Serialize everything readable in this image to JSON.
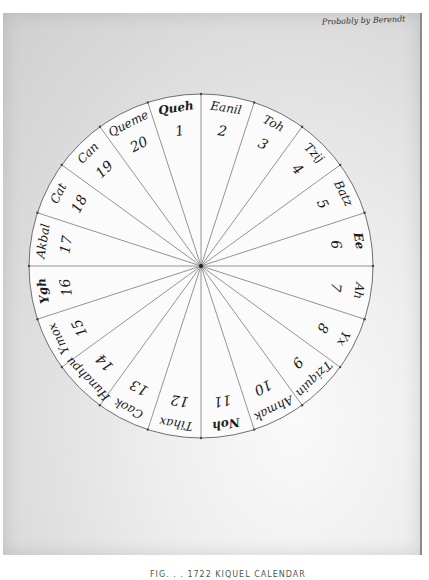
{
  "document": {
    "annotation": "Probably by Berendt",
    "caption": "FIG. . . 1722 KIQUEL CALENDAR"
  },
  "wheel": {
    "center": [
      201,
      266
    ],
    "radius": 172,
    "sectors": 20,
    "line_color": "#7a7a7a",
    "days": [
      {
        "num": "1",
        "name": "Queh"
      },
      {
        "num": "2",
        "name": "Eanil"
      },
      {
        "num": "3",
        "name": "Toh"
      },
      {
        "num": "4",
        "name": "Tzij"
      },
      {
        "num": "5",
        "name": "Batz"
      },
      {
        "num": "6",
        "name": "Ee"
      },
      {
        "num": "7",
        "name": "Ah"
      },
      {
        "num": "8",
        "name": "Yx"
      },
      {
        "num": "9",
        "name": "Tziquin"
      },
      {
        "num": "10",
        "name": "Ahmak"
      },
      {
        "num": "11",
        "name": "Noh"
      },
      {
        "num": "12",
        "name": "Tihax"
      },
      {
        "num": "13",
        "name": "Caok"
      },
      {
        "num": "14",
        "name": "Hunahpu"
      },
      {
        "num": "15",
        "name": "Ymox"
      },
      {
        "num": "16",
        "name": "Ygh"
      },
      {
        "num": "17",
        "name": "Akbal"
      },
      {
        "num": "18",
        "name": "Cat"
      },
      {
        "num": "19",
        "name": "Can"
      },
      {
        "num": "20",
        "name": "Queme"
      }
    ]
  }
}
